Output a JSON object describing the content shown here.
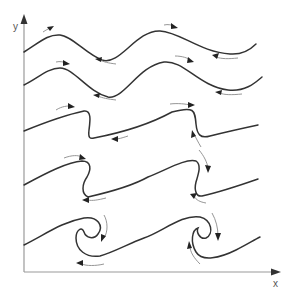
{
  "diagram": {
    "axes": {
      "x_label": "x",
      "y_label": "y"
    },
    "stages": [
      {
        "name": "stage-1",
        "description": "gentle wave"
      },
      {
        "name": "stage-2",
        "description": "steepening wave"
      },
      {
        "name": "stage-3",
        "description": "overturning crest"
      },
      {
        "name": "stage-4",
        "description": "curling crest"
      },
      {
        "name": "stage-5",
        "description": "rolled-up vortex"
      }
    ],
    "colors": {
      "curve": "#333333",
      "flow_arrow": "#8a8a8a",
      "axis": "#9a9a9a"
    }
  }
}
